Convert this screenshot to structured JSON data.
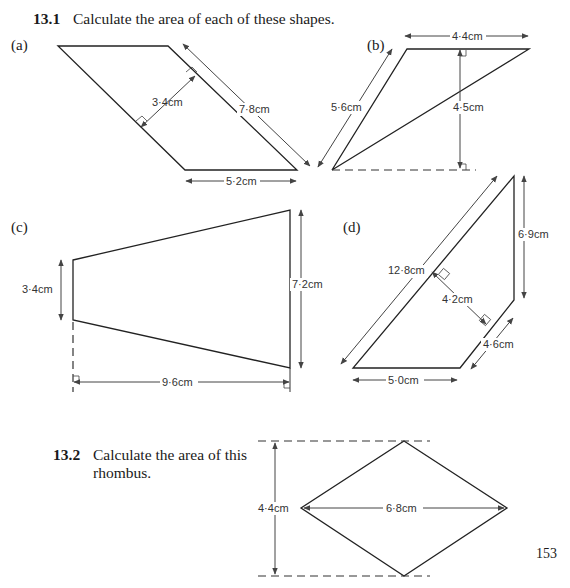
{
  "question_13_1": {
    "number": "13.1",
    "text": "Calculate the area of each of these shapes.",
    "parts": [
      {
        "label": "(a)",
        "shape": "parallelogram",
        "measurements": {
          "base": "5·2cm",
          "side": "7·8cm",
          "height": "3·4cm"
        }
      },
      {
        "label": "(b)",
        "shape": "triangle",
        "measurements": {
          "top": "4·4cm",
          "side": "5·6cm",
          "height": "4·5cm"
        }
      },
      {
        "label": "(c)",
        "shape": "trapezium",
        "measurements": {
          "left_side": "3·4cm",
          "right_side": "7·2cm",
          "width": "9·6cm"
        }
      },
      {
        "label": "(d)",
        "shape": "trapezium",
        "measurements": {
          "long_side": "12·8cm",
          "perpendicular": "4·2cm",
          "short_side": "4·6cm",
          "vertical": "6·9cm",
          "base": "5·0cm"
        }
      }
    ]
  },
  "question_13_2": {
    "number": "13.2",
    "text_line1": "Calculate the area of this",
    "text_line2": "rhombus.",
    "measurements": {
      "height": "4·4cm",
      "width": "6·8cm"
    }
  },
  "page_number": "153"
}
